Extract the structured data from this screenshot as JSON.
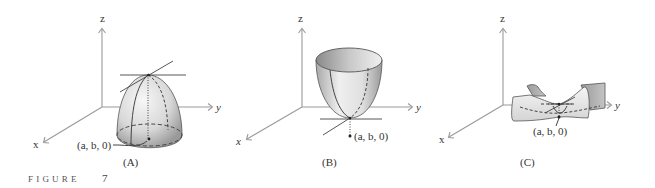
{
  "figure": {
    "caption_word": "FIGURE",
    "caption_number": "7"
  },
  "panels": [
    {
      "id": "A",
      "label": "(A)",
      "surface": "dome-maximum",
      "axes": {
        "x": "x",
        "y": "y",
        "z": "z"
      },
      "point_label": "(a, b, 0)"
    },
    {
      "id": "B",
      "label": "(B)",
      "surface": "bowl-minimum",
      "axes": {
        "x": "x",
        "y": "y",
        "z": "z"
      },
      "point_label": "(a, b, 0)"
    },
    {
      "id": "C",
      "label": "(C)",
      "surface": "saddle-point",
      "axes": {
        "x": "x",
        "y": "y",
        "z": "z"
      },
      "point_label": "(a, b, 0)"
    }
  ],
  "colors": {
    "axis": "#9a9a9a",
    "surface_light": "#f2f2f2",
    "surface_dark": "#9c9c9c",
    "ink": "#333333"
  }
}
